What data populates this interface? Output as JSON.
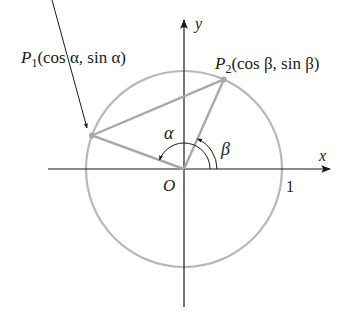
{
  "figure": {
    "axes": {
      "x_label": "x",
      "y_label": "y",
      "origin_label": "O",
      "unit_tick_label": "1"
    },
    "points": [
      {
        "name": "P1",
        "label_main": "P",
        "label_sub": "1",
        "label_coords": "(cos α, sin α)",
        "angle_label": "α",
        "angle_deg": 160
      },
      {
        "name": "P2",
        "label_main": "P",
        "label_sub": "2",
        "label_coords": "(cos β, sin β)",
        "angle_label": "β",
        "angle_deg": 66
      }
    ],
    "colors": {
      "circle": "#b8b8b8",
      "segments": "#a8a8a8",
      "axes": "#1a1a1a",
      "text": "#1a1a1a"
    }
  }
}
